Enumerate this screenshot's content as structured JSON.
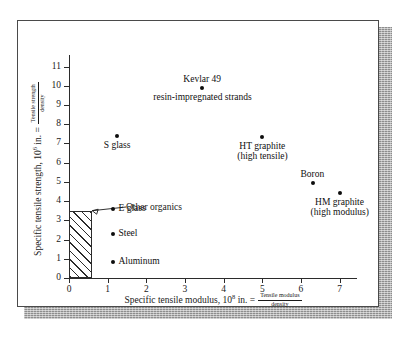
{
  "figure": {
    "background_color": "#ffffff",
    "border_color": "#4a4a4a",
    "shadow_color": "#8d8d8d"
  },
  "axes": {
    "x": {
      "title_main": "Specific tensile modulus, 10",
      "title_exponent": "8",
      "title_tail": " in. =",
      "frac_numerator": "Tensile modulus",
      "frac_denominator": "density",
      "ticks": [
        "0",
        "1",
        "2",
        "3",
        "4",
        "5",
        "6",
        "7"
      ],
      "min": 0,
      "max": 7.45
    },
    "y": {
      "title_main": "Specific tensile strength, 10",
      "title_exponent": "6",
      "title_tail": " in. =",
      "frac_numerator": "Tensile strength",
      "frac_denominator": "density",
      "ticks": [
        "0",
        "1",
        "2",
        "3",
        "4",
        "5",
        "6",
        "7",
        "8",
        "9",
        "10",
        "11"
      ],
      "min": 0,
      "max": 11.6
    }
  },
  "callout": {
    "label": "Other organics",
    "target_x": 0.6,
    "target_y": 3.5
  },
  "hatched_region": {
    "x_min": 0,
    "x_max": 0.6,
    "y_min": 0,
    "y_max": 3.5
  },
  "chart_data": {
    "type": "scatter",
    "title": "",
    "xlabel": "Specific tensile modulus, 10^8 in. = Tensile modulus / density",
    "ylabel": "Specific tensile strength, 10^6 in. = Tensile strength / density",
    "xlim": [
      0,
      7.45
    ],
    "ylim": [
      0,
      11.6
    ],
    "xticks": [
      0,
      1,
      2,
      3,
      4,
      5,
      6,
      7
    ],
    "yticks": [
      0,
      1,
      2,
      3,
      4,
      5,
      6,
      7,
      8,
      9,
      10,
      11
    ],
    "grid": false,
    "legend": "none",
    "marker_color": "#0d0d0d",
    "points": [
      {
        "name": "Kevlar 49",
        "x": 3.45,
        "y": 9.9,
        "label": "Kevlar 49",
        "sublabel": "resin-impregnated strands",
        "label_position": "above"
      },
      {
        "name": "S glass",
        "x": 1.25,
        "y": 7.4,
        "label": "S glass",
        "sublabel": "",
        "label_position": "below"
      },
      {
        "name": "HT graphite",
        "x": 5.0,
        "y": 7.35,
        "label": "HT graphite",
        "sublabel": "(high tensile)",
        "label_position": "below"
      },
      {
        "name": "Boron",
        "x": 6.3,
        "y": 4.95,
        "label": "Boron",
        "sublabel": "",
        "label_position": "above"
      },
      {
        "name": "HM graphite",
        "x": 7.0,
        "y": 4.4,
        "label": "HM graphite",
        "sublabel": "(high modulus)",
        "label_position": "below"
      },
      {
        "name": "E glass",
        "x": 1.15,
        "y": 3.6,
        "label": "E glass",
        "sublabel": "",
        "label_position": "right"
      },
      {
        "name": "Steel",
        "x": 1.15,
        "y": 2.3,
        "label": "Steel",
        "sublabel": "",
        "label_position": "right"
      },
      {
        "name": "Aluminum",
        "x": 1.15,
        "y": 0.85,
        "label": "Aluminum",
        "sublabel": "",
        "label_position": "right"
      }
    ],
    "regions": [
      {
        "name": "Other organics",
        "x_min": 0,
        "x_max": 0.6,
        "y_min": 0,
        "y_max": 3.5,
        "fill": "diagonal-hatch"
      }
    ]
  }
}
